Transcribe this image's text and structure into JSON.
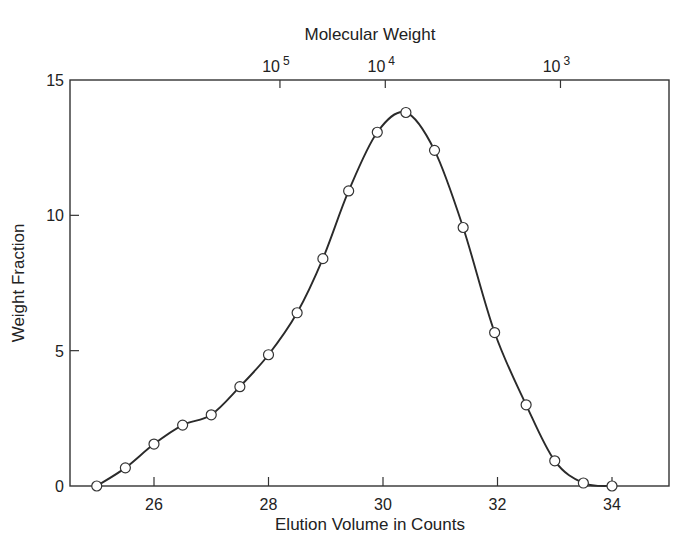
{
  "chart_data": {
    "type": "line",
    "title": "",
    "xlabel": "Elution Volume in Counts",
    "ylabel": "Weight Fraction",
    "secondary_xlabel": "Molecular Weight",
    "xlim": [
      24.53,
      35.0
    ],
    "ylim": [
      0,
      15
    ],
    "x_ticks": [
      26,
      28,
      30,
      32,
      34
    ],
    "x_tick_labels": [
      "26",
      "28",
      "30",
      "32",
      "34"
    ],
    "y_ticks": [
      0,
      5,
      10,
      15
    ],
    "y_tick_labels": [
      "0",
      "5",
      "10",
      "15"
    ],
    "secondary_x_ticks": [
      {
        "label_base": "10",
        "label_exp": "5",
        "position": 28.2
      },
      {
        "label_base": "10",
        "label_exp": "4",
        "position": 30.04
      },
      {
        "label_base": "10",
        "label_exp": "3",
        "position": 33.1
      }
    ],
    "grid": false,
    "legend": null,
    "series": [
      {
        "name": "Weight Fraction",
        "marker": "open-circle",
        "smooth_line": true,
        "x": [
          25.0,
          25.5,
          26.0,
          26.5,
          27.0,
          27.5,
          28.0,
          28.5,
          28.95,
          29.4,
          29.9,
          30.4,
          30.9,
          31.4,
          31.95,
          32.5,
          33.0,
          33.5,
          34.0
        ],
        "y": [
          0.0,
          0.67,
          1.55,
          2.25,
          2.63,
          3.67,
          4.85,
          6.4,
          8.4,
          10.9,
          13.07,
          13.8,
          12.4,
          9.55,
          5.67,
          3.0,
          0.93,
          0.11,
          0.0
        ]
      }
    ]
  },
  "layout": {
    "plot_left": 70,
    "plot_right": 669,
    "plot_top": 80,
    "plot_bottom": 486
  }
}
